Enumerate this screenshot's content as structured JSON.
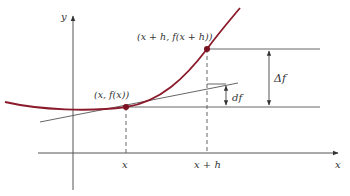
{
  "diagram": {
    "title": "",
    "colors": {
      "curve": "#8b1a2b",
      "point": "#7a1020",
      "lines": "#444444",
      "text": "#333333"
    },
    "axes": {
      "x_label": "x",
      "y_label": "y"
    },
    "points": [
      {
        "id": "p1",
        "label": "(x, f(x))"
      },
      {
        "id": "p2",
        "label": "(x + h, f(x + h))"
      }
    ],
    "tick_labels": {
      "x": "x",
      "x_plus_h": "x + h"
    },
    "annotations": {
      "delta_f": "Δf",
      "df": "df"
    },
    "elements": [
      "curve y = f(x)",
      "tangent line at (x, f(x))",
      "dashed vertical guides at x and x + h",
      "horizontal reference lines at f(x) and f(x + h)",
      "double-headed arrow Δf",
      "double-headed arrow df"
    ]
  }
}
